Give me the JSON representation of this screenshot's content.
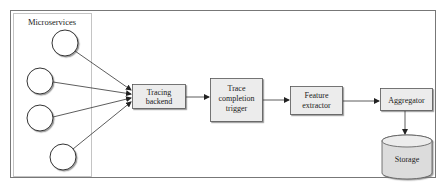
{
  "diagram": {
    "group": {
      "label": "Microservices",
      "nodes": [
        "",
        "",
        "",
        ""
      ]
    },
    "nodes": {
      "tracing_backend": {
        "lines": [
          "Tracing",
          "backend"
        ]
      },
      "trace_completion_trigger": {
        "lines": [
          "Trace",
          "completion",
          "trigger"
        ]
      },
      "feature_extractor": {
        "lines": [
          "Feature",
          "extractor"
        ]
      },
      "aggregator": {
        "lines": [
          "Aggregator"
        ]
      },
      "storage": {
        "lines": [
          "Storage"
        ]
      }
    },
    "edges": [
      {
        "from": "microservice-1",
        "to": "tracing_backend"
      },
      {
        "from": "microservice-2",
        "to": "tracing_backend"
      },
      {
        "from": "microservice-3",
        "to": "tracing_backend"
      },
      {
        "from": "microservice-4",
        "to": "tracing_backend"
      },
      {
        "from": "tracing_backend",
        "to": "trace_completion_trigger"
      },
      {
        "from": "trace_completion_trigger",
        "to": "feature_extractor"
      },
      {
        "from": "feature_extractor",
        "to": "aggregator"
      },
      {
        "from": "aggregator",
        "to": "storage"
      }
    ],
    "colors": {
      "box_fill": "#ececec",
      "stroke": "#333333",
      "panel_border": "#bdbdbd",
      "outer_border": "#777777"
    }
  }
}
